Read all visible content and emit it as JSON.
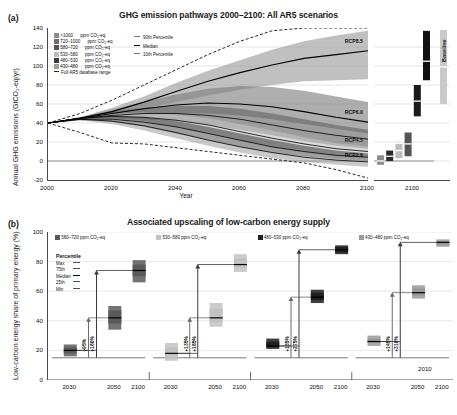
{
  "panel_a": {
    "tag": "(a)",
    "title": "GHG emission pathways 2000–2100: All AR5 scenarios",
    "ylabel": "Annual GHG emissions (GtCO₂-eq/yr)",
    "xlabel": "Year",
    "yticks": [
      140,
      120,
      100,
      80,
      60,
      40,
      20,
      0,
      -20
    ],
    "xticks": [
      "2000",
      "2020",
      "2040",
      "2060",
      "2080",
      "2100"
    ],
    "right_panel_tick": "2100",
    "baseline_label": "Baseline",
    "legend_bands": [
      {
        "label": ">1000",
        "unit": "ppm CO₂-eq",
        "color": "#8c8c8c"
      },
      {
        "label": "720–1000",
        "unit": "ppm CO₂-eq",
        "color": "#6e6e6e"
      },
      {
        "label": "580–720",
        "unit": "ppm CO₂-eq",
        "color": "#545454"
      },
      {
        "label": "530–580",
        "unit": "ppm CO₂-eq",
        "color": "#bdbdbd"
      },
      {
        "label": "480–530",
        "unit": "ppm CO₂-eq",
        "color": "#3a3a3a"
      },
      {
        "label": "430–480",
        "unit": "ppm CO₂-eq",
        "color": "#9e9e9e"
      }
    ],
    "legend_dashed": "Full AR5 database range",
    "legend_percentiles": [
      "90th Percentile",
      "Median",
      "10th Percentile"
    ],
    "rcp_labels": [
      "RCP8.5",
      "RCP6.0",
      "RCP4.5",
      "RCP2.6"
    ],
    "chart_data": {
      "type": "area",
      "title": "GHG emission pathways 2000–2100: All AR5 scenarios",
      "xlabel": "Year",
      "ylabel": "Annual GHG emissions (GtCO₂-eq/yr)",
      "xlim": [
        2000,
        2100
      ],
      "ylim": [
        -20,
        140
      ],
      "grid": true,
      "x": [
        2000,
        2010,
        2020,
        2030,
        2040,
        2050,
        2060,
        2070,
        2080,
        2090,
        2100
      ],
      "series": [
        {
          "name": ">1000 ppm CO₂-eq",
          "p90": [
            40,
            46,
            56,
            68,
            82,
            95,
            106,
            117,
            126,
            132,
            137
          ],
          "median": [
            40,
            45,
            52,
            62,
            73,
            84,
            93,
            101,
            108,
            112,
            116
          ],
          "p10": [
            40,
            44,
            49,
            55,
            62,
            69,
            75,
            80,
            84,
            85,
            86
          ]
        },
        {
          "name": "720–1000 ppm CO₂-eq",
          "p90": [
            40,
            46,
            54,
            62,
            70,
            76,
            79,
            78,
            74,
            68,
            62
          ],
          "median": [
            40,
            45,
            50,
            55,
            59,
            61,
            60,
            57,
            52,
            46,
            41
          ],
          "p10": [
            40,
            44,
            47,
            49,
            50,
            50,
            48,
            44,
            39,
            34,
            29
          ]
        },
        {
          "name": "580–720 ppm CO₂-eq",
          "p90": [
            40,
            46,
            52,
            56,
            58,
            58,
            55,
            50,
            44,
            38,
            33
          ],
          "median": [
            40,
            45,
            48,
            50,
            50,
            48,
            44,
            38,
            32,
            27,
            23
          ],
          "p10": [
            40,
            44,
            45,
            44,
            42,
            38,
            33,
            27,
            21,
            16,
            13
          ]
        },
        {
          "name": "530–580 ppm CO₂-eq",
          "p90": [
            40,
            46,
            50,
            51,
            49,
            45,
            39,
            32,
            25,
            19,
            15
          ],
          "median": [
            40,
            45,
            47,
            46,
            43,
            38,
            31,
            24,
            18,
            13,
            10
          ],
          "p10": [
            40,
            44,
            44,
            41,
            36,
            30,
            23,
            16,
            11,
            7,
            5
          ]
        },
        {
          "name": "480–530 ppm CO₂-eq",
          "p90": [
            40,
            45,
            47,
            46,
            42,
            36,
            29,
            22,
            16,
            11,
            8
          ],
          "median": [
            40,
            44,
            44,
            41,
            36,
            29,
            22,
            15,
            10,
            6,
            4
          ],
          "p10": [
            40,
            43,
            41,
            36,
            29,
            22,
            15,
            9,
            5,
            2,
            0
          ]
        },
        {
          "name": "430–480 ppm CO₂-eq",
          "p90": [
            40,
            45,
            45,
            42,
            36,
            29,
            21,
            14,
            9,
            5,
            3
          ],
          "median": [
            40,
            44,
            42,
            37,
            30,
            22,
            15,
            9,
            4,
            1,
            -1
          ],
          "p10": [
            40,
            43,
            39,
            32,
            24,
            16,
            9,
            3,
            -1,
            -4,
            -6
          ]
        }
      ],
      "full_range_upper": [
        40,
        50,
        64,
        80,
        96,
        112,
        126,
        137,
        140,
        140,
        140
      ],
      "full_range_lower": [
        40,
        30,
        19,
        18,
        14,
        10,
        6,
        2,
        -2,
        -9,
        -18
      ],
      "rcp_end_values_2100": {
        "RCP8.5": 122,
        "RCP6.0": 47,
        "RCP4.5": 18,
        "RCP2.6": 2
      },
      "bars_2100": [
        {
          "name": "430–480 ppm CO₂-eq",
          "color": "#8c8c8c",
          "min": -4,
          "p25": -2,
          "median": 0,
          "p75": 3,
          "max": 6
        },
        {
          "name": "480–530 ppm CO₂-eq",
          "color": "#2b2b2b",
          "min": 0,
          "p25": 3,
          "median": 5,
          "p75": 8,
          "max": 11
        },
        {
          "name": "530–580 ppm CO₂-eq",
          "color": "#bdbdbd",
          "min": 3,
          "p25": 7,
          "median": 11,
          "p75": 15,
          "max": 18
        },
        {
          "name": "580–720 ppm CO₂-eq",
          "color": "#555555",
          "min": 5,
          "p25": 12,
          "median": 18,
          "p75": 24,
          "max": 30
        },
        {
          "name": "720–1000 ppm CO₂-eq",
          "color": "#1a1a1a",
          "min": 47,
          "p25": 55,
          "median": 63,
          "p75": 72,
          "max": 80
        },
        {
          "name": ">1000 ppm CO₂-eq",
          "color": "#111111",
          "min": 85,
          "p25": 97,
          "median": 105,
          "p75": 123,
          "max": 137
        },
        {
          "name": "Baseline",
          "color": "#c9c9c9",
          "min": 60,
          "p25": 80,
          "median": 99,
          "p75": 120,
          "max": 138
        }
      ]
    }
  },
  "panel_b": {
    "tag": "(b)",
    "title": "Associated upscaling of low-carbon energy supply",
    "ylabel": "Low-carbon energy share of primary energy (%)",
    "yticks": [
      100,
      80,
      60,
      40,
      20,
      0
    ],
    "reference_line_label": "2010",
    "percentile_legend_title": "Percentile",
    "percentile_legend_items": [
      "Max",
      "75th",
      "Median",
      "25th",
      "Min"
    ],
    "chart_data": {
      "type": "bar",
      "title": "Associated upscaling of low-carbon energy supply",
      "ylabel": "Low-carbon energy share of primary energy (%)",
      "ylim": [
        0,
        100
      ],
      "grid": true,
      "reference_line_2010": 15,
      "xticks": [
        "2030",
        "2050",
        "2100"
      ],
      "groups": [
        {
          "name": "580–720 ppm CO₂-eq",
          "color": "#5a5a5a",
          "bars": [
            {
              "year": "2030",
              "min": 16,
              "p25": 18,
              "median": 20,
              "p75": 22,
              "max": 24
            },
            {
              "year": "2050",
              "min": 34,
              "p25": 38,
              "median": 42,
              "p75": 47,
              "max": 50
            },
            {
              "year": "2100",
              "min": 66,
              "p25": 70,
              "median": 74,
              "p75": 78,
              "max": 81
            }
          ],
          "annotations": [
            {
              "label": "+95%",
              "year": "2050"
            },
            {
              "label": "+180%",
              "year": "2100"
            }
          ]
        },
        {
          "name": "530–580 ppm CO₂-eq",
          "color": "#c2c2c2",
          "bars": [
            {
              "year": "2030",
              "min": 13,
              "p25": 16,
              "median": 18,
              "p75": 22,
              "max": 25
            },
            {
              "year": "2050",
              "min": 36,
              "p25": 39,
              "median": 42,
              "p75": 48,
              "max": 52
            },
            {
              "year": "2100",
              "min": 73,
              "p25": 76,
              "median": 78,
              "p75": 82,
              "max": 85
            }
          ],
          "annotations": [
            {
              "label": "+135%",
              "year": "2050"
            },
            {
              "label": "+185%",
              "year": "2100"
            }
          ]
        },
        {
          "name": "480–530 ppm CO₂-eq",
          "color": "#1f1f1f",
          "bars": [
            {
              "year": "2030",
              "min": 21,
              "p25": 22,
              "median": 23,
              "p75": 26,
              "max": 28
            },
            {
              "year": "2050",
              "min": 52,
              "p25": 54,
              "median": 56,
              "p75": 59,
              "max": 61
            },
            {
              "year": "2100",
              "min": 85,
              "p25": 86,
              "median": 88,
              "p75": 90,
              "max": 91
            }
          ],
          "annotations": [
            {
              "label": "+135%",
              "year": "2050"
            },
            {
              "label": "+275%",
              "year": "2100"
            }
          ]
        },
        {
          "name": "430–480 ppm CO₂-eq",
          "color": "#999999",
          "bars": [
            {
              "year": "2030",
              "min": 23,
              "p25": 25,
              "median": 26,
              "p75": 28,
              "max": 30
            },
            {
              "year": "2050",
              "min": 55,
              "p25": 57,
              "median": 59,
              "p75": 62,
              "max": 64
            },
            {
              "year": "2100",
              "min": 90,
              "p25": 91,
              "median": 93,
              "p75": 94,
              "max": 95
            }
          ],
          "annotations": [
            {
              "label": "+145%",
              "year": "2050"
            },
            {
              "label": "+310%",
              "year": "2100"
            }
          ]
        }
      ]
    }
  }
}
